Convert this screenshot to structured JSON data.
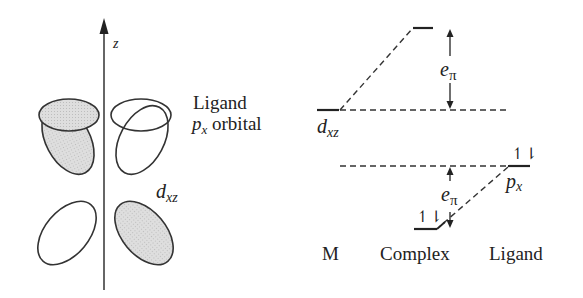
{
  "left_panel": {
    "axis_label": "z",
    "ligand_label_line1": "Ligand",
    "ligand_label_p": "p",
    "ligand_label_sub": "x",
    "ligand_label_rest": " orbital",
    "metal_orbital_d": "d",
    "metal_orbital_sub": "xz"
  },
  "right_panel": {
    "dxz_label_d": "d",
    "dxz_label_sub": "xz",
    "px_label_p": "p",
    "px_label_sub": "x",
    "epi_upper_e": "e",
    "epi_upper_sub": "π",
    "epi_lower_e": "e",
    "epi_lower_sub": "π",
    "electron_pair_px": "↿⇂",
    "electron_pair_complex": "↿⇂",
    "column_labels": [
      "M",
      "Complex",
      "Ligand"
    ]
  },
  "colors": {
    "line": "#222222",
    "shade": "#d9d9d9"
  }
}
